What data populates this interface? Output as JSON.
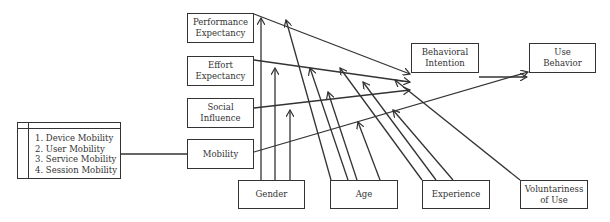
{
  "diagram": {
    "type": "UTAUT model extended with Mobility",
    "constructs": {
      "performance_expectancy": "Performance\nExpectancy",
      "effort_expectancy": "Effort\nExpectancy",
      "social_influence": "Social\nInfluence",
      "mobility": "Mobility",
      "behavioral_intention": "Behavioral\nIntention",
      "use_behavior": "Use\nBehavior"
    },
    "moderators": {
      "gender": "Gender",
      "age": "Age",
      "experience": "Experience",
      "voluntariness": "Voluntariness\nof Use"
    },
    "mobility_types": [
      "1. Device Mobility",
      "2. User Mobility",
      "3. Service Mobility",
      "4. Session Mobility"
    ],
    "line_color": "#333333"
  }
}
